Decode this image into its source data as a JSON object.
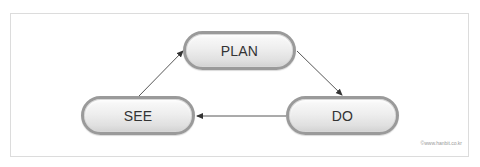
{
  "diagram": {
    "nodes": [
      {
        "id": "plan",
        "label": "PLAN"
      },
      {
        "id": "do",
        "label": "DO"
      },
      {
        "id": "see",
        "label": "SEE"
      }
    ],
    "edges": [
      {
        "from": "plan",
        "to": "do"
      },
      {
        "from": "do",
        "to": "see"
      },
      {
        "from": "see",
        "to": "plan"
      }
    ],
    "copyright": "©www.hanbit.co.kr"
  },
  "colors": {
    "pill_border": "#9a9a9a",
    "pill_fill_top": "#fbfbfb",
    "pill_fill_bottom": "#d2d2d2",
    "label_text": "#333333",
    "arrow": "#333333",
    "frame_border": "#dcdcdc"
  }
}
